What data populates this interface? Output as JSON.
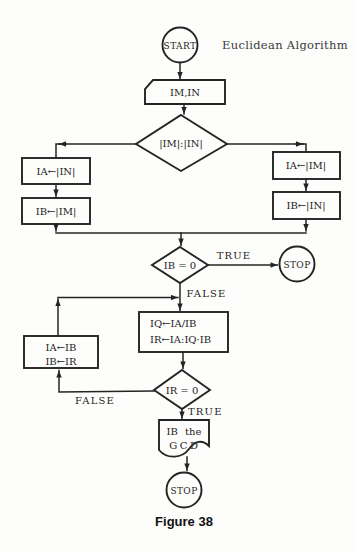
{
  "palette": {
    "paper": "#fdfdfb",
    "ink": "#242424",
    "caption_ink": "#101010"
  },
  "heading": "Euclidean Algorithm",
  "caption": "Figure 38",
  "nodes": {
    "start": "START",
    "input": "IM,IN",
    "compare": "|IM|:|IN|",
    "left_a": "IA←|IN|",
    "left_b": "IB←|IM|",
    "right_a": "IA←|IM|",
    "right_b": "IB←|IN|",
    "test_ib": "IB = 0",
    "stop_right": "STOP",
    "calc_1": "IQ←IA/IB",
    "calc_2": "IR←IA:IQ·IB",
    "swap_1": "IA←IB",
    "swap_2": "IB←IR",
    "test_ir": "IR = 0",
    "output_1": "IB the",
    "output_2": "GCD",
    "stop_bottom": "STOP"
  },
  "edge_labels": {
    "ib_true": "TRUE",
    "ib_false": "FALSE",
    "ir_true": "TRUE",
    "ir_false": "FALSE"
  }
}
